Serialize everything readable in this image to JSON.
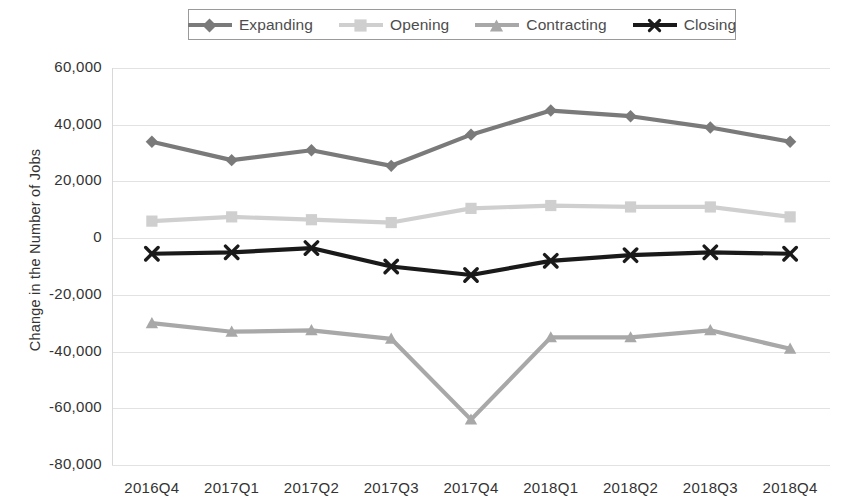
{
  "chart_data": {
    "type": "line",
    "title": "",
    "xlabel": "",
    "ylabel": "Change in the Number of Jobs",
    "categories": [
      "2016Q4",
      "2017Q1",
      "2017Q2",
      "2017Q3",
      "2017Q4",
      "2018Q1",
      "2018Q2",
      "2018Q3",
      "2018Q4"
    ],
    "ylim": [
      -80000,
      60000
    ],
    "ytick_values": [
      60000,
      40000,
      20000,
      0,
      -20000,
      -40000,
      -60000,
      -80000
    ],
    "ytick_labels": [
      "60,000",
      "40,000",
      "20,000",
      "0",
      "-20,000",
      "-40,000",
      "-60,000",
      "-80,000"
    ],
    "grid": true,
    "legend_position": "top",
    "series": [
      {
        "name": "Expanding",
        "color": "#7a7a7a",
        "marker": "diamond",
        "values": [
          34000,
          27500,
          31000,
          25500,
          36500,
          45000,
          43000,
          39000,
          34000
        ]
      },
      {
        "name": "Opening",
        "color": "#cfcfcf",
        "marker": "square",
        "values": [
          6000,
          7500,
          6500,
          5500,
          10500,
          11500,
          11000,
          11000,
          7500
        ]
      },
      {
        "name": "Contracting",
        "color": "#a8a8a8",
        "marker": "triangle",
        "values": [
          -30000,
          -33000,
          -32500,
          -35500,
          -64000,
          -35000,
          -35000,
          -32500,
          -39000
        ]
      },
      {
        "name": "Closing",
        "color": "#1a1a1a",
        "marker": "x",
        "values": [
          -5500,
          -5000,
          -3500,
          -10000,
          -13000,
          -8000,
          -6000,
          -5000,
          -5500
        ]
      }
    ]
  }
}
